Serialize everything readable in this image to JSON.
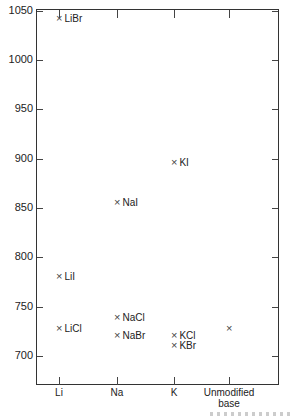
{
  "chart_data": {
    "type": "scatter",
    "title": "",
    "xlabel": "",
    "ylabel": "",
    "ylim": [
      670,
      1050
    ],
    "yticks": [
      700,
      750,
      800,
      850,
      900,
      950,
      1000,
      1050
    ],
    "categories": [
      "Li",
      "Na",
      "K",
      "Unmodified base"
    ],
    "grid": false,
    "points": [
      {
        "category": "Li",
        "label": "LiBr",
        "y": 1042
      },
      {
        "category": "Li",
        "label": "LiI",
        "y": 780
      },
      {
        "category": "Li",
        "label": "LiCl",
        "y": 727
      },
      {
        "category": "Na",
        "label": "NaI",
        "y": 855
      },
      {
        "category": "Na",
        "label": "NaCl",
        "y": 739
      },
      {
        "category": "Na",
        "label": "NaBr",
        "y": 720
      },
      {
        "category": "K",
        "label": "KI",
        "y": 896
      },
      {
        "category": "K",
        "label": "KCl",
        "y": 720
      },
      {
        "category": "K",
        "label": "KBr",
        "y": 710
      },
      {
        "category": "Unmodified base",
        "label": "",
        "y": 727
      }
    ]
  },
  "axis": {
    "y_labels": [
      "1050",
      "1000",
      "950",
      "900",
      "850",
      "800",
      "750",
      "700"
    ],
    "x_labels": [
      "Li",
      "Na",
      "K",
      "Unmodified\nbase"
    ]
  },
  "marker": "×"
}
